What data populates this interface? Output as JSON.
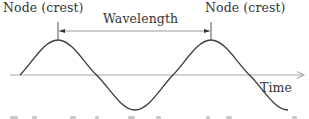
{
  "diagram": {
    "labels": {
      "node_left": "Node (crest)",
      "node_right": "Node (crest)",
      "wavelength": "Wavelength",
      "axis": "Time"
    },
    "colors": {
      "wave": "#3a3a3a",
      "axis": "#a8a8a8",
      "dimension_line": "#9a9a9a",
      "tick": "#555555",
      "text": "#333333"
    },
    "geometry": {
      "axis_y": 75,
      "amplitude_px": 35,
      "wavelength_px": 153,
      "wave_start_x": 20,
      "wave_end_x": 288,
      "crest_1_x": 58,
      "crest_2_x": 211,
      "trough_x": 135,
      "dimension_line_y": 31
    },
    "footer_text_visible": false
  }
}
